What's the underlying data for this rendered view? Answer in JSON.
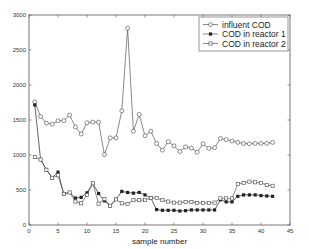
{
  "chart_data": {
    "type": "line",
    "title": "",
    "xlabel": "sample number",
    "ylabel": "",
    "xlim": [
      0,
      45
    ],
    "ylim": [
      0,
      3000
    ],
    "xticks": [
      0,
      5,
      10,
      15,
      20,
      25,
      30,
      35,
      40,
      45
    ],
    "yticks": [
      0,
      500,
      1000,
      1500,
      2000,
      2500,
      3000
    ],
    "grid": false,
    "legend_position": "upper right",
    "x": [
      1,
      2,
      3,
      4,
      5,
      6,
      7,
      8,
      9,
      10,
      11,
      12,
      13,
      14,
      15,
      16,
      17,
      18,
      19,
      20,
      21,
      22,
      23,
      24,
      25,
      26,
      27,
      28,
      29,
      30,
      31,
      32,
      33,
      34,
      35,
      36,
      37,
      38,
      39,
      40,
      41,
      42
    ],
    "series": [
      {
        "name": "influent COD",
        "marker": "circle",
        "values": [
          1760,
          1550,
          1455,
          1440,
          1490,
          1490,
          1570,
          1400,
          1300,
          1460,
          1470,
          1470,
          1005,
          1245,
          1245,
          1630,
          2810,
          1340,
          1580,
          1275,
          1340,
          1165,
          1070,
          1190,
          1130,
          1050,
          1115,
          1100,
          1040,
          1160,
          1095,
          1105,
          1235,
          1220,
          1200,
          1180,
          1165,
          1160,
          1165,
          1165,
          1165,
          1180
        ]
      },
      {
        "name": "COD in reactor 1",
        "marker": "filled-square",
        "values": [
          1715,
          935,
          790,
          675,
          755,
          445,
          465,
          385,
          395,
          460,
          595,
          450,
          345,
          275,
          365,
          480,
          465,
          455,
          465,
          430,
          385,
          220,
          210,
          210,
          210,
          200,
          205,
          215,
          215,
          215,
          215,
          215,
          360,
          330,
          330,
          410,
          430,
          430,
          430,
          420,
          415,
          410
        ]
      },
      {
        "name": "COD in reactor 2",
        "marker": "open-square",
        "values": [
          970,
          935,
          790,
          675,
          710,
          445,
          465,
          335,
          310,
          430,
          595,
          305,
          370,
          275,
          365,
          310,
          300,
          355,
          355,
          355,
          385,
          385,
          355,
          335,
          320,
          320,
          330,
          330,
          315,
          315,
          315,
          320,
          380,
          380,
          380,
          585,
          600,
          620,
          610,
          600,
          570,
          560
        ]
      }
    ]
  },
  "legend": {
    "items": [
      {
        "label": "influent COD"
      },
      {
        "label": "COD in reactor 1"
      },
      {
        "label": "COD in reactor 2"
      }
    ]
  }
}
